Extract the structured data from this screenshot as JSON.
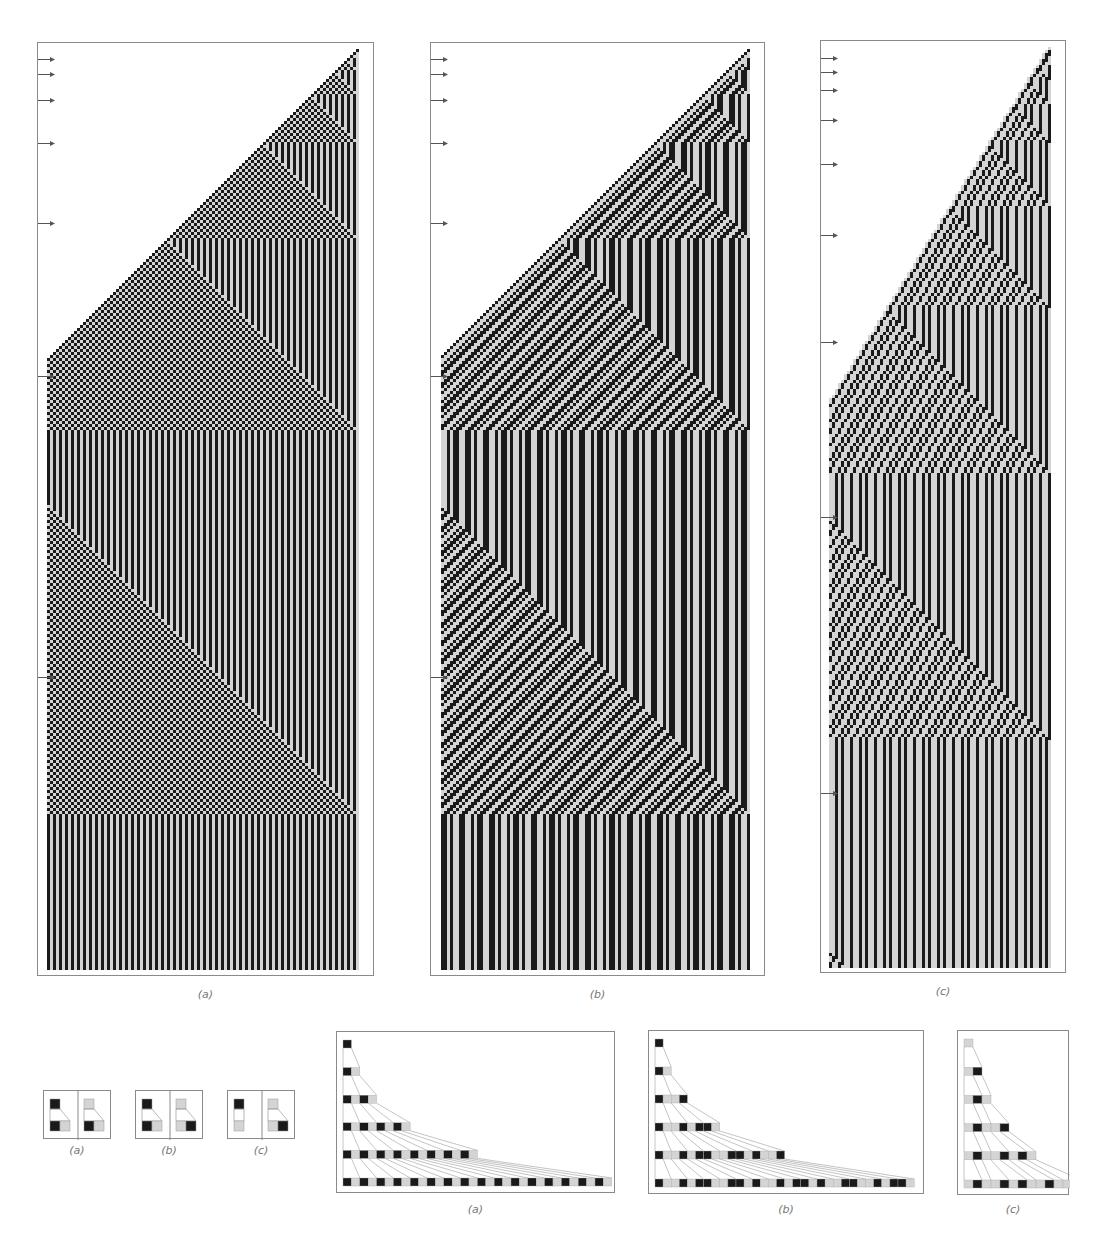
{
  "colors": {
    "black": "#1a1a1a",
    "gray": "#d4d4d4",
    "frame": "#8a8a8a",
    "arrow": "#555555",
    "caption": "#777777"
  },
  "rules": {
    "a": {
      "label": "(a)",
      "B": [
        "B",
        "G"
      ],
      "G": [
        "B",
        "G"
      ],
      "start": "B"
    },
    "b": {
      "label": "(b)",
      "B": [
        "B",
        "G"
      ],
      "G": [
        "G",
        "B"
      ],
      "start": "B"
    },
    "c": {
      "label": "(c)",
      "B": [
        "G"
      ],
      "G": [
        "G",
        "B"
      ],
      "start": "G"
    }
  },
  "large_panels": [
    {
      "id": "a",
      "caption": "(a)",
      "x": 37,
      "y": 42,
      "w": 337,
      "h": 934,
      "arrows_y": [
        49,
        64,
        90,
        133,
        213,
        366,
        667
      ],
      "caption_y": 988
    },
    {
      "id": "b",
      "caption": "(b)",
      "x": 430,
      "y": 42,
      "w": 335,
      "h": 934,
      "arrows_y": [
        49,
        64,
        90,
        133,
        213,
        366,
        667
      ],
      "caption_y": 988
    },
    {
      "id": "c",
      "caption": "(c)",
      "x": 820,
      "y": 40,
      "w": 246,
      "h": 933,
      "arrows_y": [
        48,
        62,
        80,
        110,
        154,
        225,
        332,
        507,
        783
      ],
      "caption_y": 985
    }
  ],
  "rule_icons": [
    {
      "id": "a",
      "caption": "(a)",
      "x": 43,
      "y": 1090,
      "w": 68,
      "h": 49,
      "caption_y": 1144
    },
    {
      "id": "b",
      "caption": "(b)",
      "x": 135,
      "y": 1090,
      "w": 68,
      "h": 49,
      "caption_y": 1144
    },
    {
      "id": "c",
      "caption": "(c)",
      "x": 227,
      "y": 1090,
      "w": 68,
      "h": 49,
      "caption_y": 1144
    }
  ],
  "evolutions": [
    {
      "id": "a",
      "caption": "(a)",
      "x": 336,
      "y": 1031,
      "w": 279,
      "h": 162,
      "steps": 6,
      "cell": 10,
      "caption_y": 1203
    },
    {
      "id": "b",
      "caption": "(b)",
      "x": 648,
      "y": 1030,
      "w": 276,
      "h": 164,
      "steps": 6,
      "cell": 10,
      "caption_y": 1203
    },
    {
      "id": "c",
      "caption": "(c)",
      "x": 957,
      "y": 1030,
      "w": 112,
      "h": 165,
      "steps": 6,
      "cell": 10,
      "caption_y": 1203
    }
  ]
}
